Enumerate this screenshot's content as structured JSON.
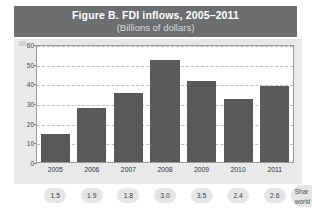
{
  "figure": {
    "title": "Figure B. FDI inflows, 2005–2011",
    "subtitle": "(Billions of dollars)",
    "title_band_color": "#6d6e70",
    "panel_color": "#e9e9ea",
    "bar_color": "#58595b"
  },
  "chart_data": {
    "type": "bar",
    "title": "Figure B. FDI inflows, 2005–2011",
    "subtitle": "(Billions of dollars)",
    "xlabel": "",
    "ylabel": "",
    "ylim": [
      0,
      60
    ],
    "yticks": [
      0,
      10,
      20,
      30,
      40,
      50,
      60
    ],
    "ytick_labels": [
      "0",
      "10",
      "20",
      "30",
      "40",
      "50",
      "60"
    ],
    "grid": true,
    "legend": false,
    "categories": [
      "2005",
      "2006",
      "2007",
      "2008",
      "2009",
      "2010",
      "2011"
    ],
    "values": [
      14.5,
      28.0,
      35.5,
      53.0,
      42.0,
      32.5,
      39.5
    ]
  },
  "share_row": {
    "label_line1": "Shar",
    "label_line2": "world",
    "values": [
      "1.5",
      "1.9",
      "1.8",
      "3.0",
      "3.5",
      "2.4",
      "2.6"
    ]
  }
}
